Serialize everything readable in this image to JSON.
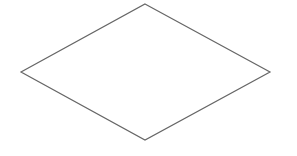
{
  "diagram": {
    "shape": "diamond",
    "vertices": {
      "top": [
        145,
        4
      ],
      "right": [
        270,
        72
      ],
      "bottom": [
        145,
        140
      ],
      "left": [
        21,
        72
      ]
    },
    "stroke_color": "#666666",
    "fill_color": "#ffffff",
    "background": "#ffffff",
    "label": ""
  }
}
